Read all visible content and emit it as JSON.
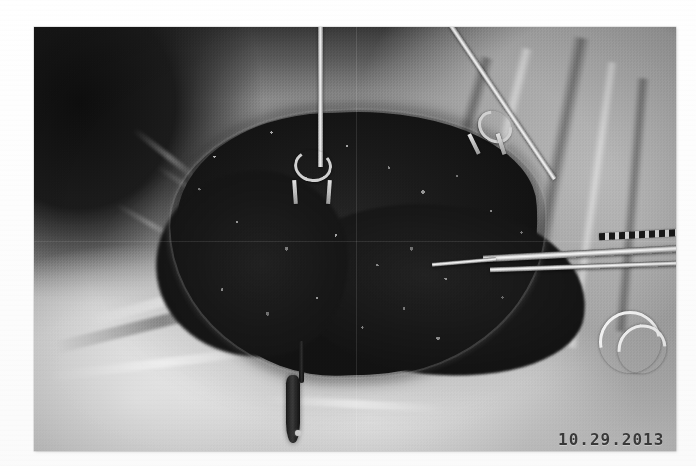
{
  "document": {
    "kind": "scanned-clinical-photograph",
    "page_background": "#ffffff"
  },
  "photo": {
    "alt": "Intraoperative photograph of a large open surgical wound of the abdominal wall with dark granulating tissue, held open by skin-hook retractors, with a clamp and a drain in the field",
    "frame": {
      "x": 34,
      "y": 27,
      "width": 642,
      "height": 424
    },
    "tone": {
      "mode": "grayscale",
      "darkest": "#141414",
      "midtone": "#9a9a9a",
      "lightest": "#e8e8e8"
    },
    "date_stamp": "10.29.2013",
    "date_stamp_color": "#3a3a3a",
    "regions": [
      {
        "name": "dark-drape-upper-left",
        "description": "Deeply shadowed surgical drape occupying the upper left corner"
      },
      {
        "name": "surgical-drape-right",
        "description": "Mid-gray woven drape sheet draped over the right side of the field"
      },
      {
        "name": "patient-skin-lower",
        "description": "Light prepped abdominal skin below the wound"
      },
      {
        "name": "drape-fold-lower-left",
        "description": "Bright folded drape edge across the lower left"
      },
      {
        "name": "wound-bed",
        "description": "Large dark granulating / necrotic wound bed at the center of the field"
      },
      {
        "name": "wound-margin",
        "description": "Highlighted incision margin around the wound bed"
      }
    ],
    "instruments": [
      {
        "name": "skin-hook-retractor-center",
        "description": "Double-pronged skin hook retractor descending vertically into the top of the wound"
      },
      {
        "name": "skin-hook-retractor-right",
        "description": "Second skin hook retractor angled in from the upper right corner"
      },
      {
        "name": "clamp-forceps",
        "description": "Long straight clamp / forceps lying horizontally across the right of the field with a serrated jaw"
      },
      {
        "name": "penrose-drain",
        "description": "Dark drain / tube hanging down from the inferior wound edge"
      },
      {
        "name": "tubing-loop",
        "description": "Curved loop of clear tubing at the lower right edge of the photograph"
      }
    ]
  }
}
